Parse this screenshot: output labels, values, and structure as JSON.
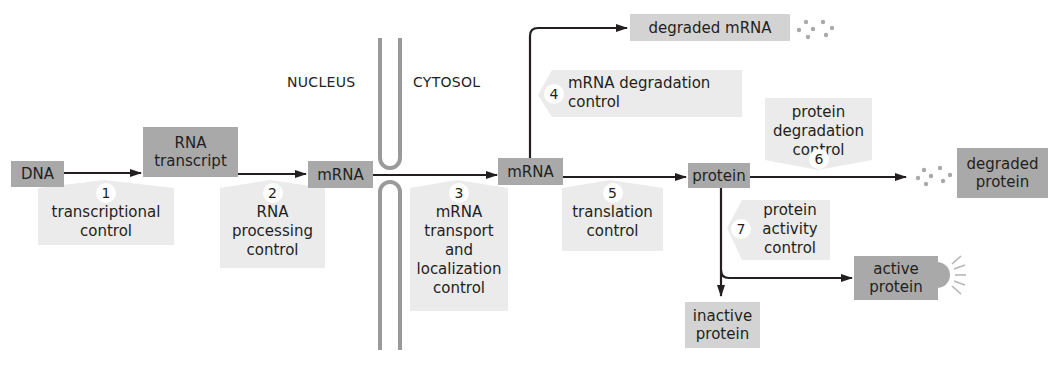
{
  "regions": {
    "nucleus": "NUCLEUS",
    "cytosol": "CYTOSOL"
  },
  "nodes": {
    "dna": "DNA",
    "rna_transcript": [
      "RNA",
      "transcript"
    ],
    "mrna_nucleus": "mRNA",
    "mrna_cytosol": "mRNA",
    "protein": "protein",
    "degraded_mrna": "degraded mRNA",
    "degraded_protein": [
      "degraded",
      "protein"
    ],
    "active_protein": [
      "active",
      "protein"
    ],
    "inactive_protein": [
      "inactive",
      "protein"
    ]
  },
  "controls": [
    {
      "number": "1",
      "lines": [
        "transcriptional",
        "control"
      ]
    },
    {
      "number": "2",
      "lines": [
        "RNA",
        "processing",
        "control"
      ]
    },
    {
      "number": "3",
      "lines": [
        "mRNA",
        "transport",
        "and",
        "localization",
        "control"
      ]
    },
    {
      "number": "4",
      "lines": [
        "mRNA degradation",
        "control"
      ]
    },
    {
      "number": "5",
      "lines": [
        "translation",
        "control"
      ]
    },
    {
      "number": "6",
      "lines": [
        "protein",
        "degradation",
        "control"
      ]
    },
    {
      "number": "7",
      "lines": [
        "protein",
        "activity",
        "control"
      ]
    }
  ],
  "colors": {
    "node_dark": "#a9a9a9",
    "node_light": "#d3d3d3",
    "control_fill": "#ebebeb",
    "membrane": "#9a9a9a",
    "arrow": "#231f20"
  }
}
